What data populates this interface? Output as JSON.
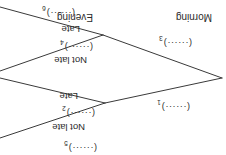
{
  "figure": {
    "type": "probability-tree-diagram",
    "orientation": "rotated-180",
    "blank_token": "(······)"
  },
  "stages": {
    "first": [
      {
        "id": "morning",
        "label": "Morning"
      },
      {
        "id": "evening",
        "label": "Evening"
      }
    ]
  },
  "branches": {
    "morning_not_late": "Not late",
    "morning_late": "Late",
    "evening_not_late": "Not late",
    "evening_late": "Late"
  },
  "blanks": [
    {
      "n": "1",
      "dots": "(······)",
      "index": "1",
      "for": "morning"
    },
    {
      "n": "2",
      "dots": "(······)",
      "index": "2",
      "for": "morning-not-late"
    },
    {
      "n": "3",
      "dots": "(······)",
      "index": "3",
      "for": "evening"
    },
    {
      "n": "4",
      "dots": "(······)",
      "index": "4",
      "for": "evening-not-late"
    },
    {
      "n": "5",
      "dots": "(······)",
      "index": "5",
      "for": "evening-second"
    },
    {
      "n": "6",
      "dots": "(······)",
      "index": "6",
      "for": "evening-second-not-late"
    }
  ],
  "style": {
    "line_color": "#3a3a3a",
    "text_color": "#2b2b2b",
    "background": "#ffffff"
  }
}
